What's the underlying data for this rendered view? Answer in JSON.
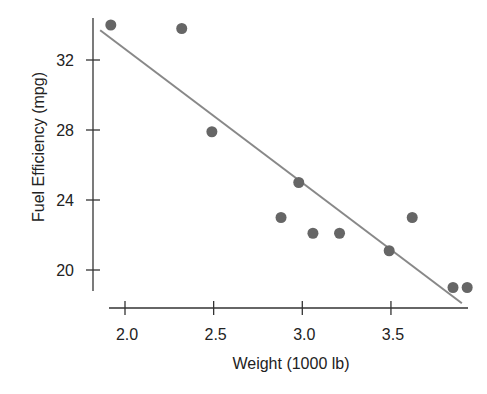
{
  "chart_data": {
    "type": "scatter",
    "title": "",
    "xlabel": "Weight (1000 lb)",
    "ylabel": "Fuel Efficiency (mpg)",
    "xlim": [
      1.82,
      3.97
    ],
    "ylim": [
      18.2,
      35.0
    ],
    "x_ticks": [
      2.0,
      2.5,
      3.0,
      3.5
    ],
    "x_tick_labels": [
      "2.0",
      "2.5",
      "3.0",
      "3.5"
    ],
    "y_ticks": [
      20,
      24,
      28,
      32
    ],
    "y_tick_labels": [
      "20",
      "24",
      "28",
      "32"
    ],
    "grid": false,
    "legend": null,
    "series": [
      {
        "name": "cars",
        "type": "scatter",
        "points": [
          {
            "x": 1.92,
            "y": 34.0
          },
          {
            "x": 2.32,
            "y": 33.8
          },
          {
            "x": 2.49,
            "y": 27.9
          },
          {
            "x": 2.88,
            "y": 23.0
          },
          {
            "x": 2.98,
            "y": 25.0
          },
          {
            "x": 3.06,
            "y": 22.1
          },
          {
            "x": 3.21,
            "y": 22.1
          },
          {
            "x": 3.49,
            "y": 21.1
          },
          {
            "x": 3.62,
            "y": 23.0
          },
          {
            "x": 3.85,
            "y": 19.0
          },
          {
            "x": 3.93,
            "y": 19.0
          }
        ]
      },
      {
        "name": "regression line",
        "type": "line",
        "points": [
          {
            "x": 1.86,
            "y": 33.7
          },
          {
            "x": 3.9,
            "y": 18.1
          }
        ]
      }
    ]
  },
  "colors": {
    "points": "#666666",
    "line": "#888888",
    "axis": "#333333",
    "text": "#222222"
  }
}
